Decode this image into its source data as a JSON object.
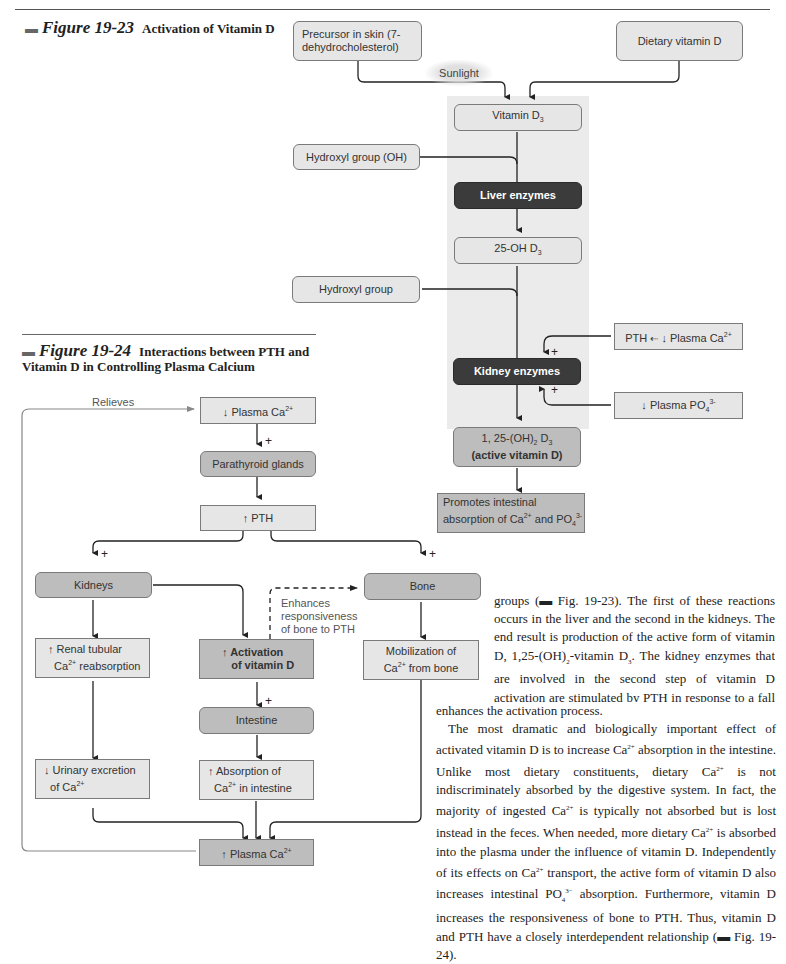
{
  "fig23": {
    "number": "Figure 19-23",
    "title": "Activation of Vitamin D",
    "boxes": {
      "precursor": "Precursor in skin (7-dehydrocholesterol)",
      "dietary": "Dietary vitamin D",
      "sunlight": "Sunlight",
      "vitamin_d3": "Vitamin D3",
      "hydroxyl_oh": "Hydroxyl group (OH)",
      "liver": "Liver enzymes",
      "oh25": "25-OH D3",
      "hydroxyl": "Hydroxyl group",
      "pth_ca": "PTH ← ↓ Plasma Ca2+",
      "kidney": "Kidney enzymes",
      "po4": "↓ Plasma PO4 3-",
      "active_line1": "1, 25-(OH)2 D3",
      "active_line2": "(active vitamin D)",
      "promotes": "Promotes intestinal absorption of Ca2+ and PO4 3-"
    },
    "signs": [
      "+",
      "+",
      "+"
    ]
  },
  "fig24": {
    "number": "Figure 19-24",
    "title": "Interactions between PTH and Vitamin D in Controlling Plasma Calcium",
    "boxes": {
      "plasma_ca_down": "↓ Plasma Ca2+",
      "parathyroid": "Parathyroid glands",
      "pth_up": "↑ PTH",
      "kidneys": "Kidneys",
      "bone": "Bone",
      "renal": "↑ Renal tubular Ca2+ reabsorption",
      "activation": "↑ Activation of vitamin D",
      "mobilization": "Mobilization of Ca2+ from bone",
      "intestine": "Intestine",
      "urinary": "↓ Urinary excretion of Ca2+",
      "absorption": "↑ Absorption of Ca2+ in intestine",
      "plasma_ca_up": "↑ Plasma Ca2+"
    },
    "labels": {
      "relieves": "Relieves",
      "enhances": "Enhances responsiveness of bone to PTH"
    }
  },
  "body": {
    "paragraph1": "groups (▬ Fig. 19-23). The first of these reactions occurs in the liver and the second in the kidneys. The end result is production of the active form of vitamin D, 1,25-(OH)2-vitamin D3. The kidney enzymes that are involved in the second step of vitamin D activation are stimulated by PTH in response to a fall in plasma Ca2+. To a lesser extent, a fall in plasma PO4 3− also enhances the activation process.",
    "paragraph2": "The most dramatic and biologically important effect of activated vitamin D is to increase Ca2+ absorption in the intestine. Unlike most dietary constituents, dietary Ca2+ is not indiscriminately absorbed by the digestive system. In fact, the majority of ingested Ca2+ is typically not absorbed but is lost instead in the feces. When needed, more dietary Ca2+ is absorbed into the plasma under the influence of vitamin D. Independently of its effects on Ca2+ transport, the active form of vitamin D also increases intestinal PO4 3− absorption. Furthermore, vitamin D increases the responsiveness of bone to PTH. Thus, vitamin D and PTH have a closely interdependent relationship (▬ Fig. 19-24)."
  }
}
